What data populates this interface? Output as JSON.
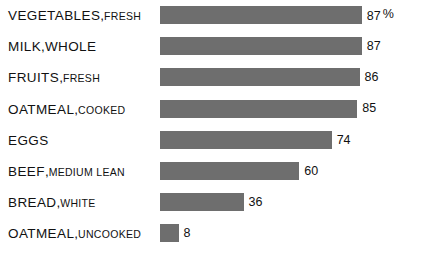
{
  "chart_data": {
    "type": "bar",
    "orientation": "horizontal",
    "title": "",
    "xlabel": "",
    "ylabel": "",
    "unit": "%",
    "unit_label": "%",
    "xlim": [
      0,
      100
    ],
    "grid": false,
    "legend": false,
    "categories": [
      "VEGETABLES, FRESH",
      "MILK, WHOLE",
      "FRUITS, FRESH",
      "OATMEAL, COOKED",
      "EGGS",
      "BEEF, MEDIUM LEAN",
      "BREAD, WHITE",
      "OATMEAL, UNCOOKED"
    ],
    "values": [
      87,
      87,
      86,
      85,
      74,
      60,
      36,
      8
    ],
    "value_labels": [
      "87",
      "87",
      "86",
      "85",
      "74",
      "60",
      "36",
      "8"
    ],
    "bars": [
      {
        "label_main": "VEGETABLES",
        "label_sep": ",",
        "label_sub": "FRESH",
        "sub_size": "small",
        "value": 87,
        "value_label": "87",
        "value_suffix": "%"
      },
      {
        "label_main": "MILK",
        "label_sep": ",",
        "label_sub": "WHOLE",
        "sub_size": "large",
        "value": 87,
        "value_label": "87",
        "value_suffix": ""
      },
      {
        "label_main": "FRUITS",
        "label_sep": ",",
        "label_sub": "FRESH",
        "sub_size": "small",
        "value": 86,
        "value_label": "86",
        "value_suffix": ""
      },
      {
        "label_main": "OATMEAL",
        "label_sep": ",",
        "label_sub": "COOKED",
        "sub_size": "small",
        "value": 85,
        "value_label": "85",
        "value_suffix": ""
      },
      {
        "label_main": "EGGS",
        "label_sep": "",
        "label_sub": "",
        "sub_size": "small",
        "value": 74,
        "value_label": "74",
        "value_suffix": ""
      },
      {
        "label_main": "BEEF",
        "label_sep": ",",
        "label_sub": "MEDIUM LEAN",
        "sub_size": "small",
        "value": 60,
        "value_label": "60",
        "value_suffix": ""
      },
      {
        "label_main": "BREAD",
        "label_sep": ",",
        "label_sub": "WHITE",
        "sub_size": "small",
        "value": 36,
        "value_label": "36",
        "value_suffix": ""
      },
      {
        "label_main": "OATMEAL",
        "label_sep": ",",
        "label_sub": "UNCOOKED",
        "sub_size": "small",
        "value": 8,
        "value_label": "8",
        "value_suffix": ""
      }
    ],
    "colors": {
      "bar": "#6e6e6e",
      "text": "#111111",
      "background": "#ffffff"
    }
  }
}
